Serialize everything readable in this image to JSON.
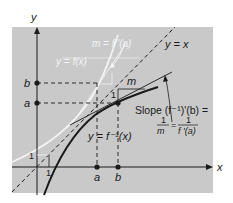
{
  "axes": {
    "x_label": "x",
    "y_label": "y"
  },
  "tick_labels": {
    "x_a": "a",
    "x_b": "b",
    "y_a": "a",
    "y_b": "b",
    "unit_x": "1",
    "unit_y": "1"
  },
  "curves": {
    "f_label": "y = f(x)",
    "f_tangent_slope_label": "m = f '(a)",
    "identity_label": "y = x",
    "inverse_label": "y = f⁻¹(x)",
    "inverse_tangent_slope_label": "m"
  },
  "slope_triangle": {
    "run_label": "1",
    "rise_label": "m"
  },
  "annotation": {
    "line1": "Slope (f⁻¹)'(b) =",
    "frac1_num": "1",
    "frac1_den": "m",
    "equals": "=",
    "frac2_num": "1",
    "frac2_den": "f '(a)"
  },
  "colors": {
    "panel_background": "#c9c9c9",
    "axis": "#1a1a1a",
    "f_curve": "#f4f4f4",
    "inverse_curve": "#1a1a1a",
    "dashed": "#1a1a1a"
  }
}
